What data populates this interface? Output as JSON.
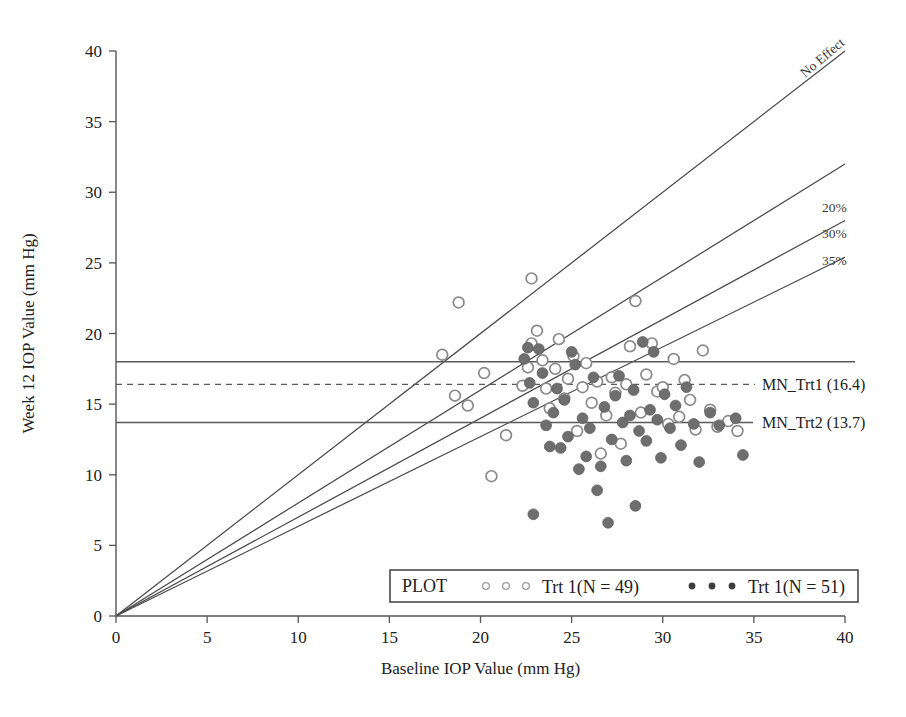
{
  "chart_data": {
    "type": "scatter",
    "title": "",
    "xlabel": "Baseline IOP Value (mm Hg)",
    "ylabel": "Week 12 IOP Value (mm Hg)",
    "xlim": [
      0,
      40
    ],
    "ylim": [
      0,
      40
    ],
    "xticks": [
      0,
      5,
      10,
      15,
      20,
      25,
      30,
      35,
      40
    ],
    "yticks": [
      0,
      5,
      10,
      15,
      20,
      25,
      30,
      35,
      40
    ],
    "grid": false,
    "legend_position": "bottom-center",
    "series": [
      {
        "name": "Trt 1(N = 49)",
        "marker": "open-circle",
        "n": 49,
        "color": "#ffffff",
        "edge_color": "#8a8a8a",
        "points": [
          [
            18.8,
            22.2
          ],
          [
            22.8,
            23.9
          ],
          [
            17.9,
            18.5
          ],
          [
            18.6,
            15.6
          ],
          [
            19.3,
            14.9
          ],
          [
            20.2,
            17.2
          ],
          [
            20.6,
            9.9
          ],
          [
            21.4,
            12.8
          ],
          [
            22.3,
            16.3
          ],
          [
            22.6,
            17.6
          ],
          [
            22.8,
            19.3
          ],
          [
            23.1,
            20.2
          ],
          [
            23.4,
            18.1
          ],
          [
            23.6,
            16.1
          ],
          [
            23.8,
            14.7
          ],
          [
            24.1,
            17.5
          ],
          [
            24.3,
            19.6
          ],
          [
            24.6,
            15.4
          ],
          [
            24.8,
            16.8
          ],
          [
            25.1,
            18.4
          ],
          [
            25.3,
            13.1
          ],
          [
            25.6,
            16.2
          ],
          [
            25.8,
            17.9
          ],
          [
            26.1,
            15.1
          ],
          [
            26.4,
            16.6
          ],
          [
            26.6,
            11.5
          ],
          [
            26.9,
            14.2
          ],
          [
            27.2,
            16.9
          ],
          [
            27.4,
            15.8
          ],
          [
            27.7,
            12.2
          ],
          [
            28.0,
            16.4
          ],
          [
            28.2,
            19.1
          ],
          [
            28.5,
            22.3
          ],
          [
            28.8,
            14.4
          ],
          [
            29.1,
            17.1
          ],
          [
            29.4,
            19.3
          ],
          [
            29.7,
            15.9
          ],
          [
            30.0,
            16.2
          ],
          [
            30.3,
            13.6
          ],
          [
            30.6,
            18.2
          ],
          [
            30.9,
            14.1
          ],
          [
            31.2,
            16.7
          ],
          [
            31.5,
            15.3
          ],
          [
            31.8,
            13.2
          ],
          [
            32.2,
            18.8
          ],
          [
            32.6,
            14.6
          ],
          [
            33.0,
            13.4
          ],
          [
            33.6,
            13.8
          ],
          [
            34.1,
            13.1
          ]
        ]
      },
      {
        "name": "Trt 1(N = 51)",
        "marker": "filled-circle",
        "n": 51,
        "color": "#6e6e6e",
        "edge_color": "#5f5f5f",
        "points": [
          [
            22.4,
            18.2
          ],
          [
            22.6,
            19.0
          ],
          [
            22.7,
            16.5
          ],
          [
            22.9,
            15.1
          ],
          [
            22.9,
            7.2
          ],
          [
            23.2,
            18.9
          ],
          [
            23.4,
            17.2
          ],
          [
            23.6,
            13.5
          ],
          [
            23.8,
            12.0
          ],
          [
            24.0,
            14.4
          ],
          [
            24.2,
            16.1
          ],
          [
            24.4,
            11.9
          ],
          [
            24.6,
            15.3
          ],
          [
            24.8,
            12.7
          ],
          [
            25.0,
            18.7
          ],
          [
            25.2,
            17.8
          ],
          [
            25.4,
            10.4
          ],
          [
            25.6,
            14.0
          ],
          [
            25.8,
            11.3
          ],
          [
            26.0,
            13.3
          ],
          [
            26.2,
            16.9
          ],
          [
            26.4,
            8.9
          ],
          [
            26.6,
            10.6
          ],
          [
            26.8,
            14.8
          ],
          [
            27.0,
            6.6
          ],
          [
            27.2,
            12.5
          ],
          [
            27.4,
            15.6
          ],
          [
            27.6,
            17.0
          ],
          [
            27.8,
            13.7
          ],
          [
            28.0,
            11.0
          ],
          [
            28.2,
            14.2
          ],
          [
            28.4,
            16.0
          ],
          [
            28.5,
            7.8
          ],
          [
            28.7,
            13.1
          ],
          [
            28.9,
            19.4
          ],
          [
            29.1,
            12.4
          ],
          [
            29.3,
            14.6
          ],
          [
            29.5,
            18.7
          ],
          [
            29.7,
            13.9
          ],
          [
            29.9,
            11.2
          ],
          [
            30.1,
            15.7
          ],
          [
            30.4,
            13.3
          ],
          [
            30.7,
            14.9
          ],
          [
            31.0,
            12.1
          ],
          [
            31.3,
            16.2
          ],
          [
            31.7,
            13.6
          ],
          [
            32.0,
            10.9
          ],
          [
            32.6,
            14.4
          ],
          [
            33.1,
            13.5
          ],
          [
            34.0,
            14.0
          ],
          [
            34.4,
            11.4
          ]
        ]
      }
    ],
    "reference_lines": [
      {
        "id": "no-effect",
        "label": "No Effect",
        "type": "diagonal",
        "slope": 1.0,
        "style": "solid"
      },
      {
        "id": "reduction-20",
        "label": "20%",
        "type": "diagonal",
        "slope": 0.8,
        "style": "solid"
      },
      {
        "id": "reduction-30",
        "label": "30%",
        "type": "diagonal",
        "slope": 0.7,
        "style": "solid"
      },
      {
        "id": "reduction-35",
        "label": "35%",
        "type": "diagonal",
        "slope": 0.635,
        "style": "solid"
      },
      {
        "id": "baseline-18",
        "label": "",
        "type": "horizontal",
        "y": 18.0,
        "style": "solid"
      },
      {
        "id": "mean-trt1",
        "label": "MN_Trt1 (16.4)",
        "type": "horizontal",
        "y": 16.4,
        "style": "dashed"
      },
      {
        "id": "mean-trt2",
        "label": "MN_Trt2 (13.7)",
        "type": "horizontal",
        "y": 13.7,
        "style": "solid"
      }
    ],
    "legend": {
      "prefix": "PLOT",
      "entries": [
        {
          "label": "Trt 1(N = 49)",
          "marker": "open-circle"
        },
        {
          "label": "Trt 1(N = 51)",
          "marker": "filled-circle"
        }
      ]
    }
  },
  "colors": {
    "axis": "#555555",
    "refline": "#5a5a5a",
    "diagonal": "#4a4a4a",
    "open_marker_edge": "#8a8a8a",
    "filled_marker": "#6e6e6e",
    "text": "#1d1d1d",
    "background": "#ffffff"
  }
}
